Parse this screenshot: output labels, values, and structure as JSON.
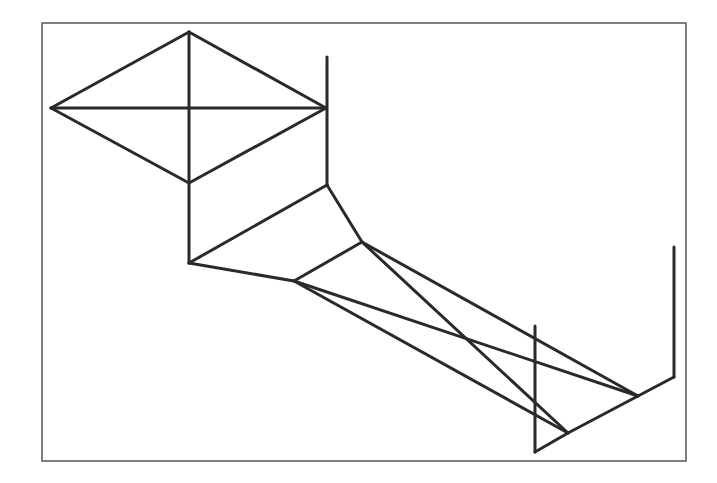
{
  "diagram": {
    "type": "line-drawing",
    "frame": {
      "x": 42,
      "y": 23,
      "width": 644,
      "height": 438,
      "stroke": "#555555"
    },
    "line_color": "#2a2a2a",
    "line_width": 3,
    "segments": [
      [
        189,
        32,
        51,
        108
      ],
      [
        189,
        32,
        326,
        108
      ],
      [
        51,
        108,
        189,
        183
      ],
      [
        326,
        108,
        189,
        183
      ],
      [
        51,
        108,
        326,
        108
      ],
      [
        189,
        32,
        189,
        263
      ],
      [
        327,
        57,
        327,
        185
      ],
      [
        189,
        263,
        327,
        185
      ],
      [
        327,
        185,
        362,
        242
      ],
      [
        362,
        242,
        294,
        281
      ],
      [
        189,
        263,
        294,
        281
      ],
      [
        362,
        242,
        638,
        396
      ],
      [
        294,
        281,
        638,
        396
      ],
      [
        362,
        242,
        568,
        433
      ],
      [
        294,
        281,
        568,
        433
      ],
      [
        535,
        326,
        535,
        452
      ],
      [
        535,
        452,
        568,
        433
      ],
      [
        568,
        433,
        638,
        396
      ],
      [
        638,
        396,
        674,
        377
      ],
      [
        674,
        247,
        674,
        377
      ]
    ]
  }
}
